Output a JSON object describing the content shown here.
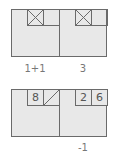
{
  "colors": {
    "cell_fill": "#e8e8e8",
    "border": "#6a6a6a",
    "text": "#555555",
    "label": "#777777"
  },
  "rows": [
    {
      "cells": [
        {
          "boxes": [
            {
              "type": "crossed"
            },
            {
              "type": "empty"
            }
          ],
          "label": "1+1"
        },
        {
          "boxes": [
            {
              "type": "crossed"
            },
            {
              "type": "empty"
            }
          ],
          "label": "3"
        }
      ]
    },
    {
      "cells": [
        {
          "boxes": [
            {
              "type": "digit",
              "value": "8"
            },
            {
              "type": "slashed"
            }
          ],
          "label": ""
        },
        {
          "boxes": [
            {
              "type": "digit",
              "value": "2"
            },
            {
              "type": "digit",
              "value": "6"
            }
          ],
          "label": "-1"
        }
      ]
    }
  ]
}
